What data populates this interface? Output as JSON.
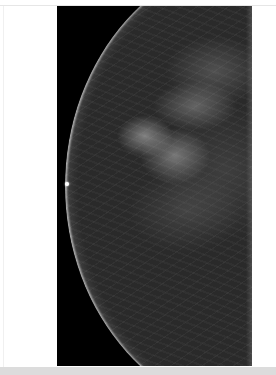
{
  "image": {
    "subject": "mammogram",
    "view": "breast profile facing left",
    "marker": "nipple marker dot",
    "colors": {
      "page_background": "#ffffff",
      "film_background": "#000000",
      "tissue": "#2a2a2a",
      "bottom_strip": "#dcdcdc"
    }
  }
}
